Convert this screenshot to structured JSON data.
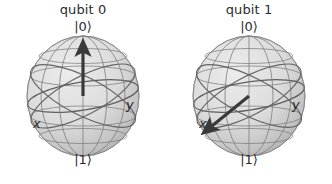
{
  "figure": {
    "background_color": "#ffffff",
    "type": "bloch-sphere-pair",
    "sphere_fill_light": "#e9e9e9",
    "sphere_fill_dark": "#b4b4b4",
    "grid_color": "#6f6f6f",
    "arrow_color": "#3a3a3a",
    "text_color": "#2b2b2b"
  },
  "panels": [
    {
      "id": "qubit-0",
      "title": "qubit 0",
      "ket_top": "|0⟩",
      "ket_bottom": "|1⟩",
      "axis_x_label": "x",
      "axis_y_label": "y",
      "state_vector": {
        "theta_deg": 0,
        "phi_deg": 0,
        "description": "arrow points straight up to |0⟩ pole"
      }
    },
    {
      "id": "qubit-1",
      "title": "qubit 1",
      "ket_top": "|0⟩",
      "ket_bottom": "|1⟩",
      "axis_x_label": "x",
      "axis_y_label": "y",
      "state_vector": {
        "theta_deg": 90,
        "phi_deg": 180,
        "description": "arrow points down-left toward the -x direction"
      }
    }
  ]
}
